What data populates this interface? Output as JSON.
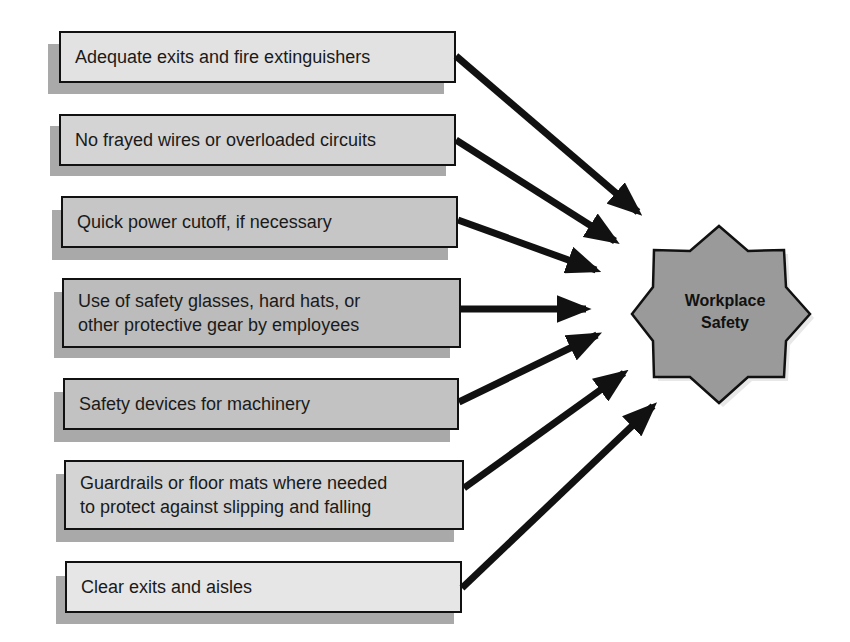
{
  "diagram": {
    "center": {
      "label": "Workplace\nSafety",
      "fill": "#9a9a9a",
      "shape": "eight-point-star"
    },
    "factors": [
      {
        "label": "Adequate exits and fire extinguishers",
        "fill": "#e2e2e2"
      },
      {
        "label": "No frayed wires or overloaded circuits",
        "fill": "#d4d4d4"
      },
      {
        "label": "Quick power cutoff, if necessary",
        "fill": "#c6c6c6"
      },
      {
        "label": "Use of safety glasses, hard hats, or\nother protective gear by employees",
        "fill": "#bcbcbc"
      },
      {
        "label": "Safety devices for machinery",
        "fill": "#c2c2c2"
      },
      {
        "label": "Guardrails or floor mats where needed\nto protect against slipping and falling",
        "fill": "#d4d4d4"
      },
      {
        "label": "Clear exits and aisles",
        "fill": "#e6e6e6"
      }
    ],
    "arrow_color": "#111111",
    "shadow_color": "#a9a9a9"
  }
}
